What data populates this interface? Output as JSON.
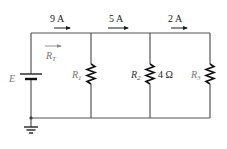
{
  "diagram": {
    "type": "parallel-dc-circuit",
    "source": {
      "label": "E"
    },
    "total_resistance": {
      "label": "R",
      "subscript": "T"
    },
    "currents": [
      {
        "label": "9 A",
        "location": "main line before R1"
      },
      {
        "label": "5 A",
        "location": "between R1 and R2"
      },
      {
        "label": "2 A",
        "location": "between R2 and R3"
      }
    ],
    "resistors": [
      {
        "label": "R",
        "subscript": "1",
        "value": ""
      },
      {
        "label": "R",
        "subscript": "2",
        "value": "4 Ω"
      },
      {
        "label": "R",
        "subscript": "3",
        "value": ""
      }
    ],
    "ground": true
  }
}
